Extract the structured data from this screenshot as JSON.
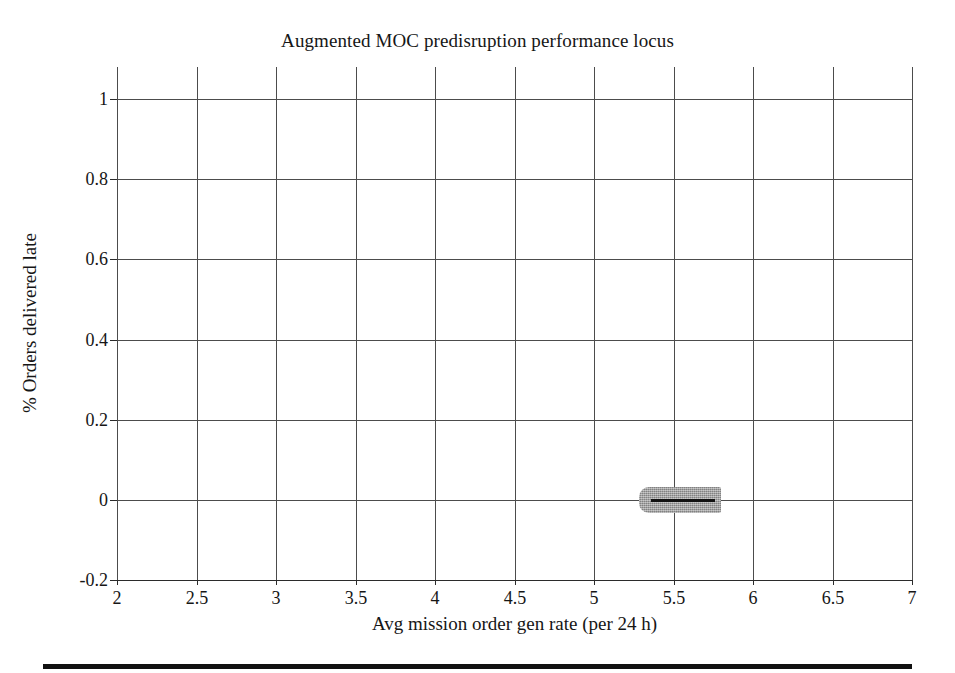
{
  "figure": {
    "title": "Augmented MOC predisruption performance locus",
    "footer_rule": true
  },
  "chart_data": {
    "type": "line",
    "title": "Augmented MOC predisruption performance locus",
    "xlabel": "Avg mission order gen rate (per 24 h)",
    "ylabel": "% Orders delivered late",
    "xlim": [
      2,
      7
    ],
    "ylim": [
      -0.2,
      1.08
    ],
    "xticks": [
      2,
      2.5,
      3,
      3.5,
      4,
      4.5,
      5,
      5.5,
      6,
      6.5,
      7
    ],
    "xticklabels": [
      "2",
      "2.5",
      "3",
      "3.5",
      "4",
      "4.5",
      "5",
      "5.5",
      "6",
      "6.5",
      "7"
    ],
    "yticks": [
      -0.2,
      0,
      0.2,
      0.4,
      0.6,
      0.8,
      1
    ],
    "yticklabels": [
      "-0.2",
      "0",
      "0.2",
      "0.4",
      "0.6",
      "0.8",
      "1"
    ],
    "grid": true,
    "legend": "none",
    "series": [
      {
        "name": "performance locus",
        "style": "thick-grey-band-with-dark-core",
        "band_color": "#9d9d9d",
        "core_color": "#111111",
        "x": [
          5.28,
          5.4,
          5.5,
          5.6,
          5.7,
          5.8
        ],
        "values": [
          0,
          0,
          0,
          0,
          0,
          0
        ],
        "x_start": 5.28,
        "x_end": 5.8,
        "y_constant": 0,
        "band_thickness_y": 0.05
      }
    ],
    "annotations": []
  },
  "colors": {
    "grid": "#4c4c4c",
    "axis": "#2b2b2b",
    "text": "#161616",
    "band": "#9d9d9d",
    "core": "#111111",
    "background": "#ffffff"
  }
}
